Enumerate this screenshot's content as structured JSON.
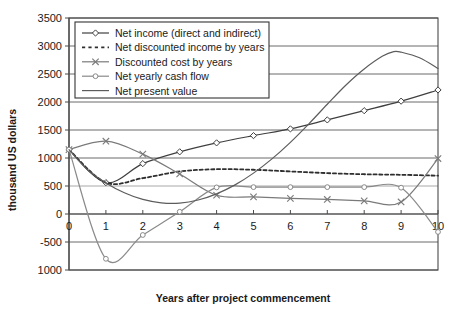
{
  "chart_data": {
    "type": "line",
    "title": "",
    "xlabel": "Years after project commencement",
    "ylabel": "thousand US dollars",
    "x": [
      0,
      1,
      2,
      3,
      4,
      5,
      6,
      7,
      8,
      9,
      10
    ],
    "xlim": [
      0,
      10
    ],
    "ylim": [
      -1000,
      3500
    ],
    "ytick_values": [
      3500,
      3000,
      2500,
      2000,
      1500,
      1000,
      500,
      0,
      -500,
      -1000
    ],
    "ytick_labels": [
      "3500",
      "3000",
      "2500",
      "2000",
      "1500",
      "1000",
      "500",
      "0",
      "-500",
      "1000"
    ],
    "xtick_labels": [
      "0",
      "1",
      "2",
      "3",
      "4",
      "5",
      "6",
      "7",
      "8",
      "9",
      "10"
    ],
    "grid": true,
    "legend_position": "upper-left-inside",
    "series": [
      {
        "name": "Net income (direct and indirect)",
        "marker": "diamond",
        "style": "solid",
        "color": "#3f3f3f",
        "values": [
          1150,
          560,
          900,
          1110,
          1270,
          1400,
          1520,
          1680,
          1845,
          2015,
          2215
        ]
      },
      {
        "name": "Net discounted income by years",
        "marker": "none",
        "style": "dashed",
        "color": "#2e2e2e",
        "values": [
          1150,
          560,
          640,
          760,
          800,
          790,
          760,
          730,
          710,
          700,
          685
        ]
      },
      {
        "name": "Discounted cost by years",
        "marker": "cross",
        "style": "solid",
        "color": "#7a7a7a",
        "values": [
          1150,
          1300,
          1070,
          715,
          335,
          305,
          280,
          260,
          235,
          215,
          990
        ]
      },
      {
        "name": "Net yearly cash flow",
        "marker": "circle",
        "style": "solid",
        "color": "#8a8a8a",
        "values": [
          1150,
          -800,
          -375,
          40,
          475,
          480,
          480,
          480,
          480,
          470,
          -320
        ]
      },
      {
        "name": "Net present value",
        "marker": "none",
        "style": "solid",
        "color": "#5c5c5c",
        "values": [
          1150,
          20,
          -35,
          30,
          480,
          485,
          485,
          485,
          495,
          475,
          480
        ]
      }
    ],
    "net_present_value_curve": {
      "note": "smooth rising curve peaking near year 8.7",
      "points": [
        [
          0,
          1150
        ],
        [
          0.5,
          790
        ],
        [
          1,
          555
        ],
        [
          1.5,
          380
        ],
        [
          2,
          260
        ],
        [
          2.5,
          200
        ],
        [
          3,
          195
        ],
        [
          3.5,
          250
        ],
        [
          4,
          360
        ],
        [
          4.5,
          520
        ],
        [
          5,
          730
        ],
        [
          5.5,
          985
        ],
        [
          6,
          1280
        ],
        [
          6.5,
          1610
        ],
        [
          7,
          1960
        ],
        [
          7.5,
          2300
        ],
        [
          8,
          2590
        ],
        [
          8.5,
          2820
        ],
        [
          8.8,
          2900
        ],
        [
          9,
          2890
        ],
        [
          9.5,
          2790
        ],
        [
          10,
          2600
        ]
      ]
    }
  },
  "legend": {
    "entries": [
      {
        "label": "Net income (direct and indirect)",
        "icon": "line-diamond-marker-icon"
      },
      {
        "label": "Net discounted income by years",
        "icon": "dashed-line-icon"
      },
      {
        "label": "Discounted cost by years",
        "icon": "line-cross-marker-icon"
      },
      {
        "label": "Net yearly cash flow",
        "icon": "line-circle-marker-icon"
      },
      {
        "label": "Net present value",
        "icon": "solid-line-icon"
      }
    ]
  },
  "axes": {
    "y_title": "thousand US dollars",
    "x_title": "Years after project commencement"
  }
}
